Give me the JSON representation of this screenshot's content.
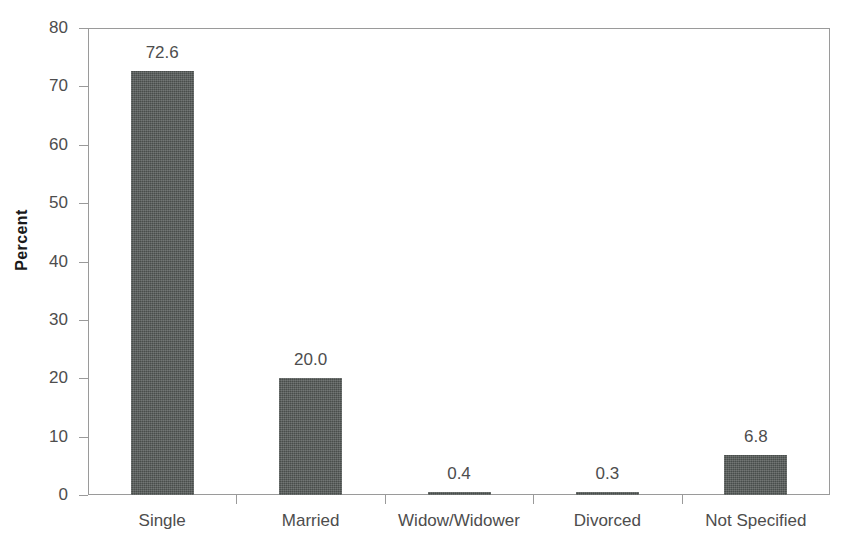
{
  "chart_data": {
    "type": "bar",
    "title": "",
    "xlabel": "",
    "ylabel": "Percent",
    "categories": [
      "Single",
      "Married",
      "Widow/Widower",
      "Divorced",
      "Not Specified"
    ],
    "values": [
      72.6,
      20.0,
      0.4,
      0.3,
      6.8
    ],
    "value_labels": [
      "72.6",
      "20.0",
      "0.4",
      "0.3",
      "6.8"
    ],
    "ylim": [
      0,
      80
    ],
    "ytick_step": 10,
    "ytick_labels": [
      "0",
      "10",
      "20",
      "30",
      "40",
      "50",
      "60",
      "70",
      "80"
    ],
    "grid": false,
    "legend": false,
    "legend_position": "none",
    "bar_color": "#555a58",
    "axis_color": "#9a9a9a",
    "text_color": "#4d4d4d",
    "axis_title_color": "#1a1a1a"
  }
}
